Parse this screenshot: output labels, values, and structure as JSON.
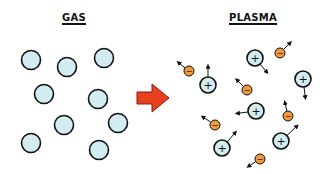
{
  "titles": {
    "left": "GAS",
    "right": "PLASMA"
  },
  "colors": {
    "particle_fill": "#d3ecf2",
    "electron_fill": "#f09a3c",
    "arrow_fill": "#e8401f",
    "outline": "#111111"
  },
  "labels": {
    "ion_sign": "+",
    "electron_sign": "−"
  },
  "gas_particles": [
    {
      "x": 31,
      "y": 60
    },
    {
      "x": 67,
      "y": 67
    },
    {
      "x": 104,
      "y": 58
    },
    {
      "x": 44,
      "y": 94
    },
    {
      "x": 98,
      "y": 99
    },
    {
      "x": 64,
      "y": 125
    },
    {
      "x": 118,
      "y": 123
    },
    {
      "x": 31,
      "y": 143
    },
    {
      "x": 99,
      "y": 150
    }
  ],
  "ions": [
    {
      "x": 255,
      "y": 58,
      "dx": 10,
      "dy": 12
    },
    {
      "x": 208,
      "y": 85,
      "dx": 0,
      "dy": -16
    },
    {
      "x": 303,
      "y": 79,
      "dx": 2,
      "dy": 16
    },
    {
      "x": 256,
      "y": 111,
      "dx": -16,
      "dy": 2
    },
    {
      "x": 222,
      "y": 148,
      "dx": 12,
      "dy": -14
    },
    {
      "x": 281,
      "y": 141,
      "dx": 15,
      "dy": -14
    }
  ],
  "electrons": [
    {
      "x": 280,
      "y": 53,
      "dx": 10,
      "dy": -10
    },
    {
      "x": 189,
      "y": 71,
      "dx": -10,
      "dy": -8
    },
    {
      "x": 247,
      "y": 90,
      "dx": -10,
      "dy": -10
    },
    {
      "x": 288,
      "y": 116,
      "dx": -3,
      "dy": -13
    },
    {
      "x": 215,
      "y": 125,
      "dx": -12,
      "dy": -8
    },
    {
      "x": 260,
      "y": 159,
      "dx": -11,
      "dy": 7
    }
  ]
}
